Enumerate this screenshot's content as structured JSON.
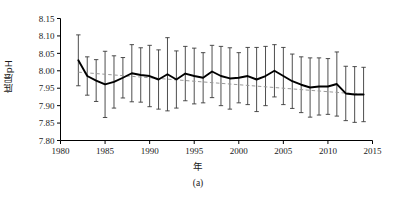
{
  "figure": {
    "caption": "(a)",
    "xlabel": "年",
    "ylabel": "底层pH"
  },
  "chart_data": {
    "type": "line",
    "title": "",
    "xlabel": "年",
    "ylabel": "底层pH",
    "xlim": [
      1980,
      2015
    ],
    "ylim": [
      7.8,
      8.15
    ],
    "xticks": [
      1980,
      1985,
      1990,
      1995,
      2000,
      2005,
      2010,
      2015
    ],
    "yticks": [
      7.8,
      7.85,
      7.9,
      7.95,
      8.0,
      8.05,
      8.1,
      8.15
    ],
    "grid": false,
    "legend": null,
    "error_bars": "vertical, symmetric, with caps",
    "series": [
      {
        "name": "底层pH",
        "style": "solid black line with vertical error bars",
        "x": [
          1982,
          1983,
          1984,
          1985,
          1986,
          1987,
          1988,
          1989,
          1990,
          1991,
          1992,
          1993,
          1994,
          1995,
          1996,
          1997,
          1998,
          1999,
          2000,
          2001,
          2002,
          2003,
          2004,
          2005,
          2006,
          2007,
          2008,
          2009,
          2010,
          2011,
          2012,
          2013,
          2014
        ],
        "values": [
          8.03,
          7.985,
          7.972,
          7.961,
          7.968,
          7.98,
          7.993,
          7.988,
          7.985,
          7.975,
          7.99,
          7.975,
          7.992,
          7.985,
          7.98,
          7.998,
          7.985,
          7.978,
          7.98,
          7.985,
          7.975,
          7.985,
          8.0,
          7.985,
          7.97,
          7.96,
          7.952,
          7.955,
          7.955,
          7.962,
          7.935,
          7.932,
          7.932
        ],
        "yerr": [
          0.073,
          0.055,
          0.06,
          0.095,
          0.075,
          0.058,
          0.082,
          0.078,
          0.088,
          0.085,
          0.105,
          0.082,
          0.078,
          0.08,
          0.072,
          0.075,
          0.085,
          0.088,
          0.072,
          0.082,
          0.092,
          0.085,
          0.075,
          0.082,
          0.078,
          0.08,
          0.085,
          0.082,
          0.08,
          0.092,
          0.078,
          0.08,
          0.078
        ]
      },
      {
        "name": "线性趋势线",
        "style": "gray dashed trend line",
        "x": [
          1982,
          2014
        ],
        "values": [
          7.996,
          7.932
        ]
      }
    ]
  }
}
